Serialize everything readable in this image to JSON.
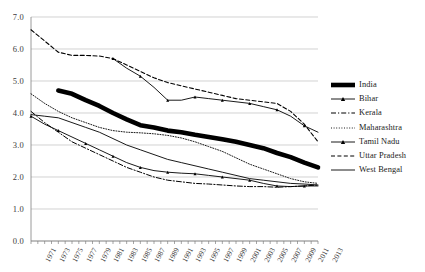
{
  "chart_data": {
    "type": "line",
    "title": "",
    "xlabel": "",
    "ylabel": "",
    "ylim": [
      0.0,
      7.0
    ],
    "ytick_labels": [
      "0.0",
      "1.0",
      "2.0",
      "3.0",
      "4.0",
      "5.0",
      "6.0",
      "7.0"
    ],
    "ytick_values": [
      0.0,
      1.0,
      2.0,
      3.0,
      4.0,
      5.0,
      6.0,
      7.0
    ],
    "grid": "horizontal",
    "legend_position": "right",
    "x": [
      1971,
      1972,
      1973,
      1974,
      1975,
      1976,
      1977,
      1978,
      1979,
      1980,
      1981,
      1982,
      1983,
      1984,
      1985,
      1986,
      1987,
      1988,
      1989,
      1990,
      1991,
      1992,
      1993,
      1994,
      1995,
      1996,
      1997,
      1998,
      1999,
      2000,
      2001,
      2002,
      2003,
      2004,
      2005,
      2006,
      2007,
      2008,
      2009,
      2010,
      2011,
      2012,
      2013
    ],
    "xtick_labels": [
      "1971",
      "1973",
      "1975",
      "1977",
      "1979",
      "1981",
      "1983",
      "1985",
      "1987",
      "1989",
      "1991",
      "1993",
      "1995",
      "1997",
      "1999",
      "2001",
      "2003",
      "2005",
      "2007",
      "2009",
      "2011",
      "2013"
    ],
    "series": [
      {
        "name": "India",
        "style": "thick-solid",
        "x": [
          1975,
          1977,
          1979,
          1981,
          1983,
          1985,
          1987,
          1989,
          1991,
          1993,
          1995,
          1997,
          1999,
          2001,
          2003,
          2005,
          2007,
          2009,
          2011,
          2013
        ],
        "values": [
          4.7,
          4.6,
          4.4,
          4.22,
          4.0,
          3.8,
          3.62,
          3.55,
          3.45,
          3.4,
          3.32,
          3.25,
          3.18,
          3.1,
          3.0,
          2.9,
          2.75,
          2.62,
          2.45,
          2.3
        ]
      },
      {
        "name": "Bihar",
        "style": "solid-marker",
        "x": [
          1983,
          1985,
          1987,
          1989,
          1991,
          1993,
          1995,
          1997,
          1999,
          2001,
          2003,
          2005,
          2007,
          2009,
          2011,
          2013
        ],
        "values": [
          5.7,
          5.4,
          5.15,
          4.8,
          4.4,
          4.4,
          4.5,
          4.45,
          4.4,
          4.35,
          4.3,
          4.2,
          4.1,
          3.9,
          3.6,
          3.4
        ]
      },
      {
        "name": "Kerala",
        "style": "dashdot",
        "x": [
          1971,
          1973,
          1975,
          1977,
          1979,
          1981,
          1983,
          1985,
          1987,
          1989,
          1991,
          1993,
          1995,
          1997,
          1999,
          2001,
          2003,
          2005,
          2007,
          2009,
          2011,
          2013
        ],
        "values": [
          4.05,
          3.7,
          3.4,
          3.1,
          2.9,
          2.7,
          2.5,
          2.3,
          2.15,
          2.0,
          1.9,
          1.85,
          1.8,
          1.78,
          1.75,
          1.72,
          1.7,
          1.7,
          1.68,
          1.7,
          1.72,
          1.75
        ]
      },
      {
        "name": "Maharashtra",
        "style": "dotted",
        "x": [
          1971,
          1973,
          1975,
          1977,
          1979,
          1981,
          1983,
          1985,
          1987,
          1989,
          1991,
          1993,
          1995,
          1997,
          1999,
          2001,
          2003,
          2005,
          2007,
          2009,
          2011,
          2013
        ],
        "values": [
          4.6,
          4.3,
          4.05,
          3.85,
          3.7,
          3.55,
          3.45,
          3.4,
          3.38,
          3.35,
          3.3,
          3.22,
          3.1,
          2.95,
          2.8,
          2.6,
          2.4,
          2.25,
          2.1,
          1.95,
          1.85,
          1.8
        ]
      },
      {
        "name": "Tamil Nadu",
        "style": "solid-marker2",
        "x": [
          1971,
          1973,
          1975,
          1977,
          1979,
          1981,
          1983,
          1985,
          1987,
          1989,
          1991,
          1993,
          1995,
          1997,
          1999,
          2001,
          2003,
          2005,
          2007,
          2009,
          2011,
          2013
        ],
        "values": [
          3.9,
          3.65,
          3.45,
          3.25,
          3.05,
          2.85,
          2.65,
          2.45,
          2.3,
          2.2,
          2.15,
          2.12,
          2.1,
          2.05,
          2.0,
          1.95,
          1.9,
          1.8,
          1.72,
          1.7,
          1.72,
          1.72
        ]
      },
      {
        "name": "Uttar Pradesh",
        "style": "dashed",
        "x": [
          1971,
          1973,
          1975,
          1977,
          1979,
          1981,
          1983,
          1985,
          1987,
          1989,
          1991,
          1993,
          1995,
          1997,
          1999,
          2001,
          2003,
          2005,
          2007,
          2009,
          2011,
          2013
        ],
        "values": [
          6.6,
          6.25,
          5.9,
          5.8,
          5.8,
          5.78,
          5.7,
          5.5,
          5.3,
          5.1,
          4.95,
          4.85,
          4.75,
          4.65,
          4.55,
          4.45,
          4.4,
          4.35,
          4.3,
          4.05,
          3.65,
          3.1
        ]
      },
      {
        "name": "West Bengal",
        "style": "solid",
        "x": [
          1971,
          1973,
          1975,
          1977,
          1979,
          1981,
          1983,
          1985,
          1987,
          1989,
          1991,
          1993,
          1995,
          1997,
          1999,
          2001,
          2003,
          2005,
          2007,
          2009,
          2011,
          2013
        ],
        "values": [
          3.95,
          3.9,
          3.85,
          3.7,
          3.55,
          3.4,
          3.2,
          3.0,
          2.85,
          2.7,
          2.55,
          2.45,
          2.35,
          2.25,
          2.15,
          2.05,
          1.95,
          1.9,
          1.85,
          1.8,
          1.78,
          1.75
        ]
      }
    ],
    "legend": [
      {
        "label": "India",
        "style": "thick-solid"
      },
      {
        "label": "Bihar",
        "style": "solid-marker"
      },
      {
        "label": "Kerala",
        "style": "dashdot"
      },
      {
        "label": "Maharashtra",
        "style": "dotted"
      },
      {
        "label": "Tamil Nadu",
        "style": "solid-marker2"
      },
      {
        "label": "Uttar Pradesh",
        "style": "dashed"
      },
      {
        "label": "West Bengal",
        "style": "solid"
      }
    ],
    "colors": {
      "line": "#000000",
      "grid": "#bfbfbf",
      "axis": "#808080",
      "text": "#1a1a1a"
    }
  }
}
